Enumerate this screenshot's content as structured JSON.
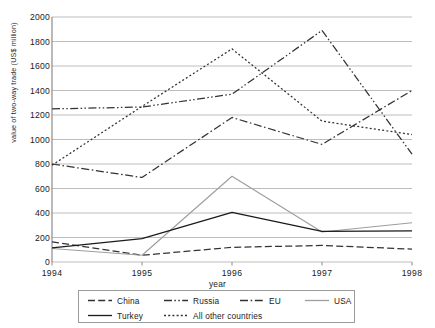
{
  "chart_data": {
    "type": "line",
    "title": "",
    "xlabel": "year",
    "ylabel": "value of two-way trade (US$ million)",
    "x": [
      "1994",
      "1995",
      "1996",
      "1997",
      "1998"
    ],
    "categories": [
      "1994",
      "1995",
      "1996",
      "1997",
      "1998"
    ],
    "ylim": [
      0,
      2000
    ],
    "yticks": [
      0,
      200,
      400,
      600,
      800,
      1000,
      1200,
      1400,
      1600,
      1800,
      2000
    ],
    "grid": true,
    "legend_position": "bottom",
    "series": [
      {
        "name": "China",
        "values": [
          165,
          55,
          120,
          135,
          105
        ],
        "style": "dashed",
        "color": "#333333"
      },
      {
        "name": "Russia",
        "values": [
          1250,
          1265,
          1370,
          1890,
          880
        ],
        "style": "dash-dot-dot",
        "color": "#333333"
      },
      {
        "name": "EU",
        "values": [
          800,
          690,
          1180,
          960,
          1400
        ],
        "style": "dash-dot",
        "color": "#333333"
      },
      {
        "name": "USA",
        "values": [
          110,
          55,
          700,
          245,
          320
        ],
        "style": "solid",
        "color": "#9e9e9e"
      },
      {
        "name": "Turkey",
        "values": [
          115,
          190,
          405,
          250,
          255
        ],
        "style": "solid",
        "color": "#1a1a1a"
      },
      {
        "name": "All other countries",
        "values": [
          790,
          1270,
          1740,
          1150,
          1040
        ],
        "style": "dotted",
        "color": "#333333"
      }
    ]
  },
  "axes": {
    "y_title": "value of two-way trade (US$ million)",
    "x_title": "year",
    "y_tick_labels": [
      "0",
      "200",
      "400",
      "600",
      "800",
      "1000",
      "1200",
      "1400",
      "1600",
      "1800",
      "2000"
    ],
    "x_tick_labels": [
      "1994",
      "1995",
      "1996",
      "1997",
      "1998"
    ]
  },
  "legend": {
    "entries": [
      {
        "label": "China"
      },
      {
        "label": "Russia"
      },
      {
        "label": "EU"
      },
      {
        "label": "USA"
      },
      {
        "label": "Turkey"
      },
      {
        "label": "All other countries"
      }
    ]
  },
  "colors": {
    "grid": "#b5b5b5",
    "axis": "#808080",
    "ink": "#333333",
    "usa": "#9e9e9e",
    "turkey": "#1a1a1a"
  }
}
